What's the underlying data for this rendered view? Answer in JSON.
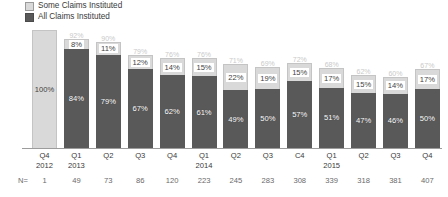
{
  "chart_data": {
    "type": "bar",
    "title": "",
    "xlabel": "",
    "ylabel": "",
    "ylim": [
      0,
      100
    ],
    "grid": false,
    "stacked": true,
    "legend_position": "top-left",
    "categories": [
      "Q4 2012",
      "Q1 2013",
      "Q2",
      "Q3",
      "Q4",
      "Q1 2014",
      "Q2",
      "Q3",
      "C4",
      "Q1 2015",
      "Q2",
      "Q3",
      "Q4"
    ],
    "series": [
      {
        "name": "All Claims Instituted",
        "color": "#595959",
        "values": [
          100,
          84,
          79,
          67,
          62,
          61,
          49,
          50,
          57,
          51,
          47,
          46,
          50
        ]
      },
      {
        "name": "Some Claims Instituted",
        "color": "#d9d9d9",
        "values": [
          0,
          8,
          11,
          12,
          14,
          15,
          22,
          19,
          15,
          17,
          15,
          14,
          17
        ]
      }
    ],
    "totals": [
      100,
      92,
      90,
      79,
      76,
      76,
      71,
      69,
      72,
      68,
      62,
      60,
      67
    ],
    "sample_sizes": [
      1,
      49,
      73,
      86,
      120,
      223,
      245,
      283,
      308,
      339,
      318,
      381,
      407
    ],
    "sample_size_prefix": "N="
  },
  "legend": {
    "items": [
      {
        "label": "Some Claims Instituted",
        "color": "#d9d9d9"
      },
      {
        "label": "All Claims Instituted",
        "color": "#595959"
      }
    ]
  },
  "xaxis": {
    "ticks": [
      {
        "quarter": "Q4",
        "year": "2012"
      },
      {
        "quarter": "Q1",
        "year": "2013"
      },
      {
        "quarter": "Q2",
        "year": ""
      },
      {
        "quarter": "Q3",
        "year": ""
      },
      {
        "quarter": "Q4",
        "year": ""
      },
      {
        "quarter": "Q1",
        "year": "2014"
      },
      {
        "quarter": "Q2",
        "year": ""
      },
      {
        "quarter": "Q3",
        "year": ""
      },
      {
        "quarter": "C4",
        "year": ""
      },
      {
        "quarter": "Q1",
        "year": "2015"
      },
      {
        "quarter": "Q2",
        "year": ""
      },
      {
        "quarter": "Q3",
        "year": ""
      },
      {
        "quarter": "Q4",
        "year": ""
      }
    ]
  },
  "bars": [
    {
      "dark": "100%",
      "light": "",
      "total": ""
    },
    {
      "dark": "84%",
      "light": "8%",
      "total": "92%"
    },
    {
      "dark": "79%",
      "light": "11%",
      "total": "90%"
    },
    {
      "dark": "67%",
      "light": "12%",
      "total": "79%"
    },
    {
      "dark": "62%",
      "light": "14%",
      "total": "76%"
    },
    {
      "dark": "61%",
      "light": "15%",
      "total": "76%"
    },
    {
      "dark": "49%",
      "light": "22%",
      "total": "71%"
    },
    {
      "dark": "50%",
      "light": "19%",
      "total": "69%"
    },
    {
      "dark": "57%",
      "light": "15%",
      "total": "72%"
    },
    {
      "dark": "51%",
      "light": "17%",
      "total": "68%"
    },
    {
      "dark": "47%",
      "light": "15%",
      "total": "62%"
    },
    {
      "dark": "46%",
      "light": "14%",
      "total": "60%"
    },
    {
      "dark": "50%",
      "light": "17%",
      "total": "67%"
    }
  ],
  "nrow": {
    "label": "N=",
    "values": [
      "1",
      "49",
      "73",
      "86",
      "120",
      "223",
      "245",
      "283",
      "308",
      "339",
      "318",
      "381",
      "407"
    ]
  }
}
